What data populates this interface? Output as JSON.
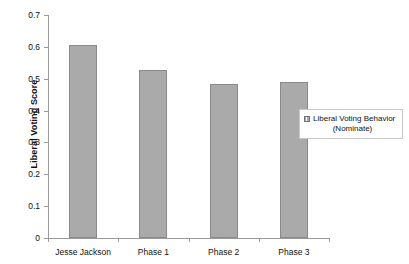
{
  "chart_data": {
    "type": "bar",
    "title": "",
    "xlabel": "",
    "ylabel": "Liberal Voting Score",
    "categories": [
      "Jesse Jackson",
      "Phase 1",
      "Phase 2",
      "Phase 3"
    ],
    "values": [
      0.606,
      0.527,
      0.483,
      0.49
    ],
    "series": [
      {
        "name": "Liberal Voting Behavior (Nominate)",
        "values": [
          0.606,
          0.527,
          0.483,
          0.49
        ]
      }
    ],
    "ylim": [
      0,
      0.7
    ],
    "ytick_labels": [
      "0.7",
      "0.6",
      "0.5",
      "0.4",
      "0.3",
      "0.2",
      "0.1",
      "0"
    ],
    "ytick_values": [
      0.7,
      0.6,
      0.5,
      0.4,
      0.3,
      0.2,
      0.1,
      0
    ],
    "grid": false,
    "legend_position": "right",
    "bar_color": "#aaaaaa",
    "bar_border_color": "#8a8a8a",
    "axis_color": "#9a9a9a"
  },
  "legend": {
    "entries": [
      {
        "line1": "Liberal Voting Behavior",
        "line2": "(Nominate)",
        "swatch": "gray-square-pattern-swatch"
      }
    ]
  }
}
